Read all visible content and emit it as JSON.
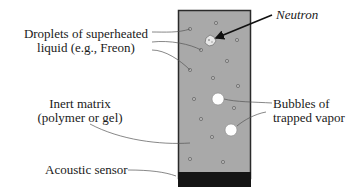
{
  "diagram": {
    "labels": {
      "droplets_line1": "Droplets of superheated",
      "droplets_line2": "liquid (e.g., Freon)",
      "neutron": "Neutron",
      "matrix_line1": "Inert matrix",
      "matrix_line2": "(polymer or gel)",
      "bubbles_line1": "Bubbles of",
      "bubbles_line2": "trapped vapor",
      "sensor": "Acoustic sensor"
    },
    "colors": {
      "matrix_fill": "#a9a9a9",
      "container_border": "#2a2a2a",
      "sensor_fill": "#151515",
      "bubble_fill": "#ffffff",
      "droplet_fill": "#b8b8b8",
      "leader_line": "#555555",
      "arrow": "#111111"
    }
  }
}
